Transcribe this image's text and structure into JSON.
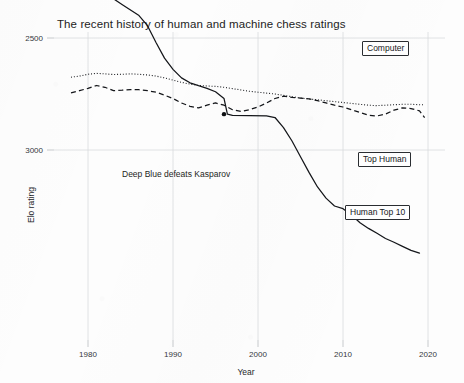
{
  "chart_data": {
    "type": "line",
    "title": "The recent history of human and machine chess ratings",
    "xlabel": "Year",
    "ylabel": "Elo rating",
    "xlim": [
      1976,
      2022
    ],
    "ylim": [
      2150,
      3520
    ],
    "xticks": [
      1980,
      1990,
      2000,
      2010,
      2020
    ],
    "xticklabels": [
      "1980",
      "1990",
      "2000",
      "2010",
      "2020"
    ],
    "yticks": [
      2500,
      3000
    ],
    "yticklabels": [
      "2500",
      "3000"
    ],
    "grid": true,
    "legend_position": "inline-callouts",
    "annotations": [
      {
        "text": "Deep Blue defeats Kasparov",
        "x": 1996,
        "y": 2840,
        "marker": "dot"
      }
    ],
    "series": [
      {
        "name": "Computer",
        "style": "solid",
        "label_text": "Computer",
        "points": [
          [
            1978,
            2197
          ],
          [
            1980,
            2250
          ],
          [
            1982,
            2300
          ],
          [
            1984,
            2350
          ],
          [
            1986,
            2400
          ],
          [
            1987,
            2445
          ],
          [
            1988,
            2520
          ],
          [
            1989,
            2590
          ],
          [
            1990,
            2640
          ],
          [
            1991,
            2678
          ],
          [
            1992,
            2700
          ],
          [
            1993,
            2713
          ],
          [
            1994,
            2725
          ],
          [
            1995,
            2740
          ],
          [
            1996,
            2770
          ],
          [
            1996.4,
            2840
          ],
          [
            1997,
            2845
          ],
          [
            1999,
            2847
          ],
          [
            2001,
            2848
          ],
          [
            2002,
            2855
          ],
          [
            2003,
            2900
          ],
          [
            2004,
            2960
          ],
          [
            2005,
            3030
          ],
          [
            2006,
            3100
          ],
          [
            2007,
            3165
          ],
          [
            2008,
            3215
          ],
          [
            2009,
            3250
          ],
          [
            2010,
            3262
          ],
          [
            2011,
            3290
          ],
          [
            2012,
            3325
          ],
          [
            2013,
            3350
          ],
          [
            2014,
            3372
          ],
          [
            2015,
            3395
          ],
          [
            2016,
            3412
          ],
          [
            2017,
            3430
          ],
          [
            2018,
            3448
          ],
          [
            2019,
            3460
          ]
        ]
      },
      {
        "name": "Top Human",
        "style": "dashed",
        "label_text": "Top Human",
        "points": [
          [
            1978,
            2745
          ],
          [
            1979,
            2735
          ],
          [
            1980,
            2725
          ],
          [
            1981,
            2712
          ],
          [
            1982,
            2720
          ],
          [
            1983,
            2735
          ],
          [
            1984,
            2733
          ],
          [
            1985,
            2730
          ],
          [
            1986,
            2731
          ],
          [
            1987,
            2735
          ],
          [
            1988,
            2742
          ],
          [
            1989,
            2755
          ],
          [
            1990,
            2770
          ],
          [
            1991,
            2790
          ],
          [
            1992,
            2805
          ],
          [
            1993,
            2812
          ],
          [
            1994,
            2800
          ],
          [
            1995,
            2790
          ],
          [
            1996,
            2800
          ],
          [
            1997,
            2820
          ],
          [
            1998,
            2828
          ],
          [
            1999,
            2820
          ],
          [
            2000,
            2808
          ],
          [
            2001,
            2790
          ],
          [
            2002,
            2770
          ],
          [
            2003,
            2760
          ],
          [
            2004,
            2765
          ],
          [
            2005,
            2768
          ],
          [
            2006,
            2772
          ],
          [
            2007,
            2780
          ],
          [
            2008,
            2790
          ],
          [
            2009,
            2800
          ],
          [
            2010,
            2808
          ],
          [
            2011,
            2820
          ],
          [
            2012,
            2832
          ],
          [
            2013,
            2845
          ],
          [
            2014,
            2848
          ],
          [
            2015,
            2840
          ],
          [
            2016,
            2822
          ],
          [
            2017,
            2812
          ],
          [
            2018,
            2815
          ],
          [
            2019,
            2825
          ],
          [
            2019.6,
            2855
          ]
        ]
      },
      {
        "name": "Human Top 10",
        "style": "dotted",
        "label_text": "Human Top 10",
        "points": [
          [
            1978,
            2675
          ],
          [
            1979,
            2670
          ],
          [
            1980,
            2662
          ],
          [
            1981,
            2658
          ],
          [
            1982,
            2660
          ],
          [
            1983,
            2663
          ],
          [
            1984,
            2662
          ],
          [
            1985,
            2660
          ],
          [
            1986,
            2662
          ],
          [
            1987,
            2665
          ],
          [
            1988,
            2670
          ],
          [
            1989,
            2678
          ],
          [
            1990,
            2688
          ],
          [
            1991,
            2698
          ],
          [
            1992,
            2706
          ],
          [
            1993,
            2712
          ],
          [
            1994,
            2714
          ],
          [
            1995,
            2716
          ],
          [
            1996,
            2720
          ],
          [
            1997,
            2726
          ],
          [
            1998,
            2732
          ],
          [
            1999,
            2738
          ],
          [
            2000,
            2742
          ],
          [
            2001,
            2746
          ],
          [
            2002,
            2750
          ],
          [
            2003,
            2756
          ],
          [
            2004,
            2762
          ],
          [
            2005,
            2768
          ],
          [
            2006,
            2772
          ],
          [
            2007,
            2776
          ],
          [
            2008,
            2780
          ],
          [
            2009,
            2784
          ],
          [
            2010,
            2788
          ],
          [
            2011,
            2792
          ],
          [
            2012,
            2796
          ],
          [
            2013,
            2800
          ],
          [
            2014,
            2802
          ],
          [
            2015,
            2800
          ],
          [
            2016,
            2798
          ],
          [
            2017,
            2796
          ],
          [
            2018,
            2796
          ],
          [
            2019,
            2798
          ],
          [
            2019.6,
            2798
          ]
        ]
      }
    ]
  },
  "callouts": {
    "computer": "Computer",
    "top_human": "Top Human",
    "human_top_10": "Human Top 10"
  },
  "annotation": {
    "deep_blue": "Deep Blue defeats Kasparov"
  },
  "axes": {
    "x_title": "Year",
    "y_title": "Elo rating"
  }
}
